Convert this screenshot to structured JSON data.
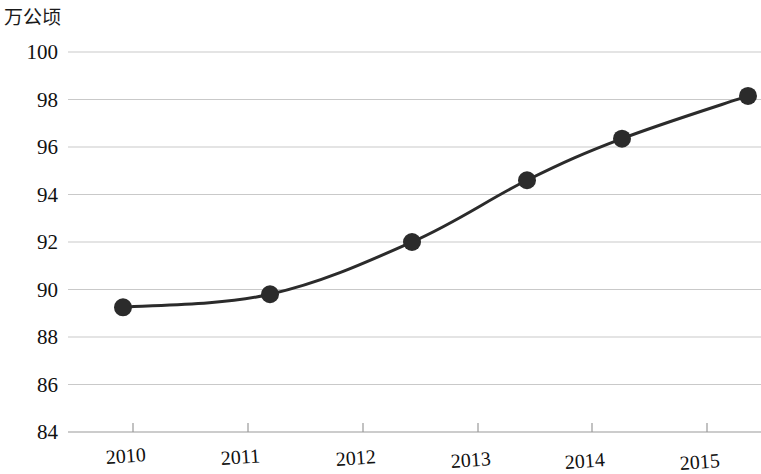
{
  "chart_data": {
    "type": "line",
    "title": "",
    "subtitle": "",
    "unit_label": "万公顷",
    "xlabel": "",
    "ylabel": "万公顷",
    "categories": [
      "2010",
      "2011",
      "2012",
      "2013",
      "2014",
      "2015"
    ],
    "x": [
      2010,
      2011,
      2012,
      2013,
      2014,
      2015
    ],
    "values": [
      89.25,
      89.8,
      92.0,
      94.6,
      96.35,
      98.15
    ],
    "series": [
      {
        "name": "面积",
        "values": [
          89.25,
          89.8,
          92.0,
          94.6,
          96.35,
          98.15
        ]
      }
    ],
    "ylim": [
      84,
      100
    ],
    "yticks": [
      84,
      86,
      88,
      90,
      92,
      94,
      96,
      98,
      100
    ],
    "ytick_labels": [
      "84",
      "86",
      "88",
      "90",
      "92",
      "94",
      "96",
      "98",
      "100"
    ],
    "xtick_labels": [
      "2010",
      "2011",
      "2012",
      "2013",
      "2014",
      "2015"
    ],
    "grid": true,
    "grid_axis": "y",
    "legend": false,
    "legend_position": "none",
    "marker": "circle",
    "line_color": "#2b2b2b",
    "marker_color": "#2b2b2b",
    "grid_color": "#c9c9c9",
    "axis_color": "#999999",
    "background_color": "#ffffff",
    "text_color": "#111111"
  }
}
